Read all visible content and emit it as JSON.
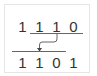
{
  "diagram": {
    "top_row": {
      "digits": [
        "1",
        "1",
        "1",
        "0"
      ]
    },
    "bottom_row": {
      "digits": [
        "1",
        "1",
        "0",
        "1"
      ]
    },
    "arrow": {
      "from": "top-row-underline",
      "to": "bottom-row-line",
      "direction": "down-left"
    },
    "colors": {
      "border": "#e6e6e6",
      "text": "#333333",
      "line": "#555555"
    }
  }
}
